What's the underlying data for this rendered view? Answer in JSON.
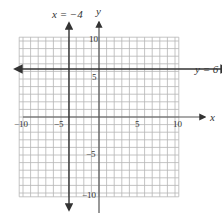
{
  "chart_data": {
    "type": "line",
    "title": "",
    "xlabel": "x",
    "ylabel": "y",
    "xlim": [
      -10,
      10
    ],
    "ylim": [
      -10,
      10
    ],
    "grid": true,
    "grid_step": 1,
    "x_ticks": [
      {
        "value": -10,
        "label": "−10"
      },
      {
        "value": -5,
        "label": "−5"
      },
      {
        "value": 5,
        "label": "5"
      },
      {
        "value": 10,
        "label": "10"
      }
    ],
    "y_ticks": [
      {
        "value": 10,
        "label": "10"
      },
      {
        "value": 5,
        "label": "5"
      },
      {
        "value": -5,
        "label": "−5"
      },
      {
        "value": -10,
        "label": "−10"
      }
    ],
    "series": [
      {
        "name": "x = −4",
        "kind": "vertical_line",
        "x": -4
      },
      {
        "name": "y = 6",
        "kind": "horizontal_line",
        "y": 6
      }
    ],
    "annotations": [
      {
        "text": "x = −4",
        "attached_to": "vertical line x=-4",
        "position": "top"
      },
      {
        "text": "y = 6",
        "attached_to": "horizontal line y=6",
        "position": "right"
      }
    ]
  },
  "labels": {
    "x_axis": "x",
    "y_axis": "y",
    "line_v": "x = −4",
    "line_h": "y = 6",
    "xt_m10": "−10",
    "xt_m5": "−5",
    "xt_5": "5",
    "xt_10": "10",
    "yt_10": "10",
    "yt_5": "5",
    "yt_m5": "−5",
    "yt_m10": "−10"
  },
  "colors": {
    "grid": "#b5b5b5",
    "axis": "#555555",
    "line": "#333333",
    "text": "#333333"
  }
}
